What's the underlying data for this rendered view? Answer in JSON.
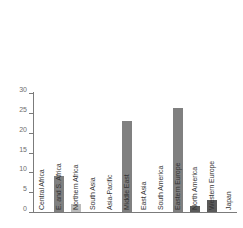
{
  "chart_data": {
    "type": "bar",
    "title": "",
    "subtitle": "",
    "xlabel": "",
    "ylabel": "",
    "ylim": [
      0,
      30
    ],
    "yticks": [
      0,
      5,
      10,
      15,
      20,
      25,
      30
    ],
    "grid": false,
    "legend": null,
    "categories": [
      "Central Africa",
      "E. and S. Africa",
      "Northern Africa",
      "South Asia",
      "Asia-Pacific",
      "Middle East",
      "East Asia",
      "South America",
      "Eastern Europe",
      "North America",
      "Western Europe",
      "Japan"
    ],
    "values": [
      0,
      9,
      2,
      0.1,
      0.1,
      23,
      0,
      0.1,
      26.3,
      1.5,
      3,
      0
    ],
    "bar_colors": [
      "#808080",
      "#808080",
      "#bcbcbc",
      "#808080",
      "#808080",
      "#808080",
      "#808080",
      "#808080",
      "#808080",
      "#5a5a5a",
      "#5a5a5a",
      "#808080"
    ]
  },
  "style": {
    "axis_color": "#7b7b7b",
    "tick_label_color": "#6e6e6e",
    "category_label_color": "#333333",
    "background": "#ffffff"
  }
}
